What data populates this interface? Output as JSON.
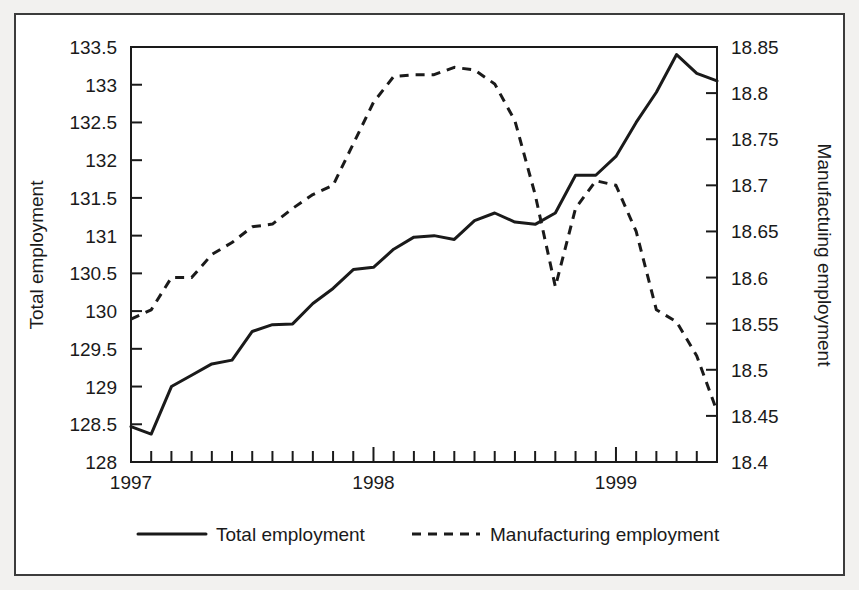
{
  "chart_data": {
    "type": "line",
    "title": "",
    "xlabel": "",
    "grid": false,
    "legend_position": "bottom",
    "x_axis": {
      "label": "",
      "tick_labels": [
        "1997",
        "1998",
        "1999"
      ],
      "tick_values": [
        1997,
        1998,
        1999
      ],
      "minor_tick_interval_months": 1,
      "xlim": [
        1997,
        1999.4167
      ]
    },
    "y_axis_left": {
      "label": "Total employment",
      "tick_labels": [
        "128",
        "128.5",
        "129",
        "129.5",
        "130",
        "130.5",
        "131",
        "131.5",
        "132",
        "132.5",
        "133",
        "133.5"
      ],
      "tick_values": [
        128,
        128.5,
        129,
        129.5,
        130,
        130.5,
        131,
        131.5,
        132,
        132.5,
        133,
        133.5
      ],
      "ylim": [
        128,
        133.5
      ]
    },
    "y_axis_right": {
      "label": "Manufactuing employment",
      "tick_labels": [
        "18.4",
        "18.45",
        "18.5",
        "18.55",
        "18.6",
        "18.65",
        "18.7",
        "18.75",
        "18.8",
        "18.85"
      ],
      "tick_values": [
        18.4,
        18.45,
        18.5,
        18.55,
        18.6,
        18.65,
        18.7,
        18.75,
        18.8,
        18.85
      ],
      "ylim": [
        18.4,
        18.85
      ]
    },
    "x": [
      1997.0,
      1997.0833,
      1997.1667,
      1997.25,
      1997.3333,
      1997.4167,
      1997.5,
      1997.5833,
      1997.6667,
      1997.75,
      1997.8333,
      1997.9167,
      1998.0,
      1998.0833,
      1998.1667,
      1998.25,
      1998.3333,
      1998.4167,
      1998.5,
      1998.5833,
      1998.6667,
      1998.75,
      1998.8333,
      1998.9167,
      1999.0,
      1999.0833,
      1999.1667,
      1999.25,
      1999.3333,
      1999.4167
    ],
    "series": [
      {
        "name": "Total employment",
        "axis": "left",
        "style": "solid",
        "color": "#1a1a1a",
        "values": [
          128.47,
          128.37,
          129.0,
          129.15,
          129.3,
          129.35,
          129.73,
          129.82,
          129.83,
          130.1,
          130.3,
          130.55,
          130.58,
          130.82,
          130.98,
          131.0,
          130.95,
          131.2,
          131.3,
          131.18,
          131.15,
          131.3,
          131.8,
          131.8,
          132.05,
          132.5,
          132.9,
          133.4,
          133.15,
          133.05
        ]
      },
      {
        "name": "Manufacturing employment",
        "axis": "right",
        "style": "dashed",
        "color": "#1a1a1a",
        "values": [
          18.555,
          18.565,
          18.6,
          18.6,
          18.625,
          18.638,
          18.655,
          18.658,
          18.675,
          18.69,
          18.7,
          18.745,
          18.79,
          18.818,
          18.82,
          18.82,
          18.828,
          18.825,
          18.81,
          18.77,
          18.69,
          18.59,
          18.675,
          18.705,
          18.7,
          18.65,
          18.565,
          18.552,
          18.515,
          18.455
        ]
      }
    ],
    "legend": [
      {
        "label": "Total employment",
        "style": "solid"
      },
      {
        "label": "Manufacturing employment",
        "style": "dashed"
      }
    ]
  }
}
